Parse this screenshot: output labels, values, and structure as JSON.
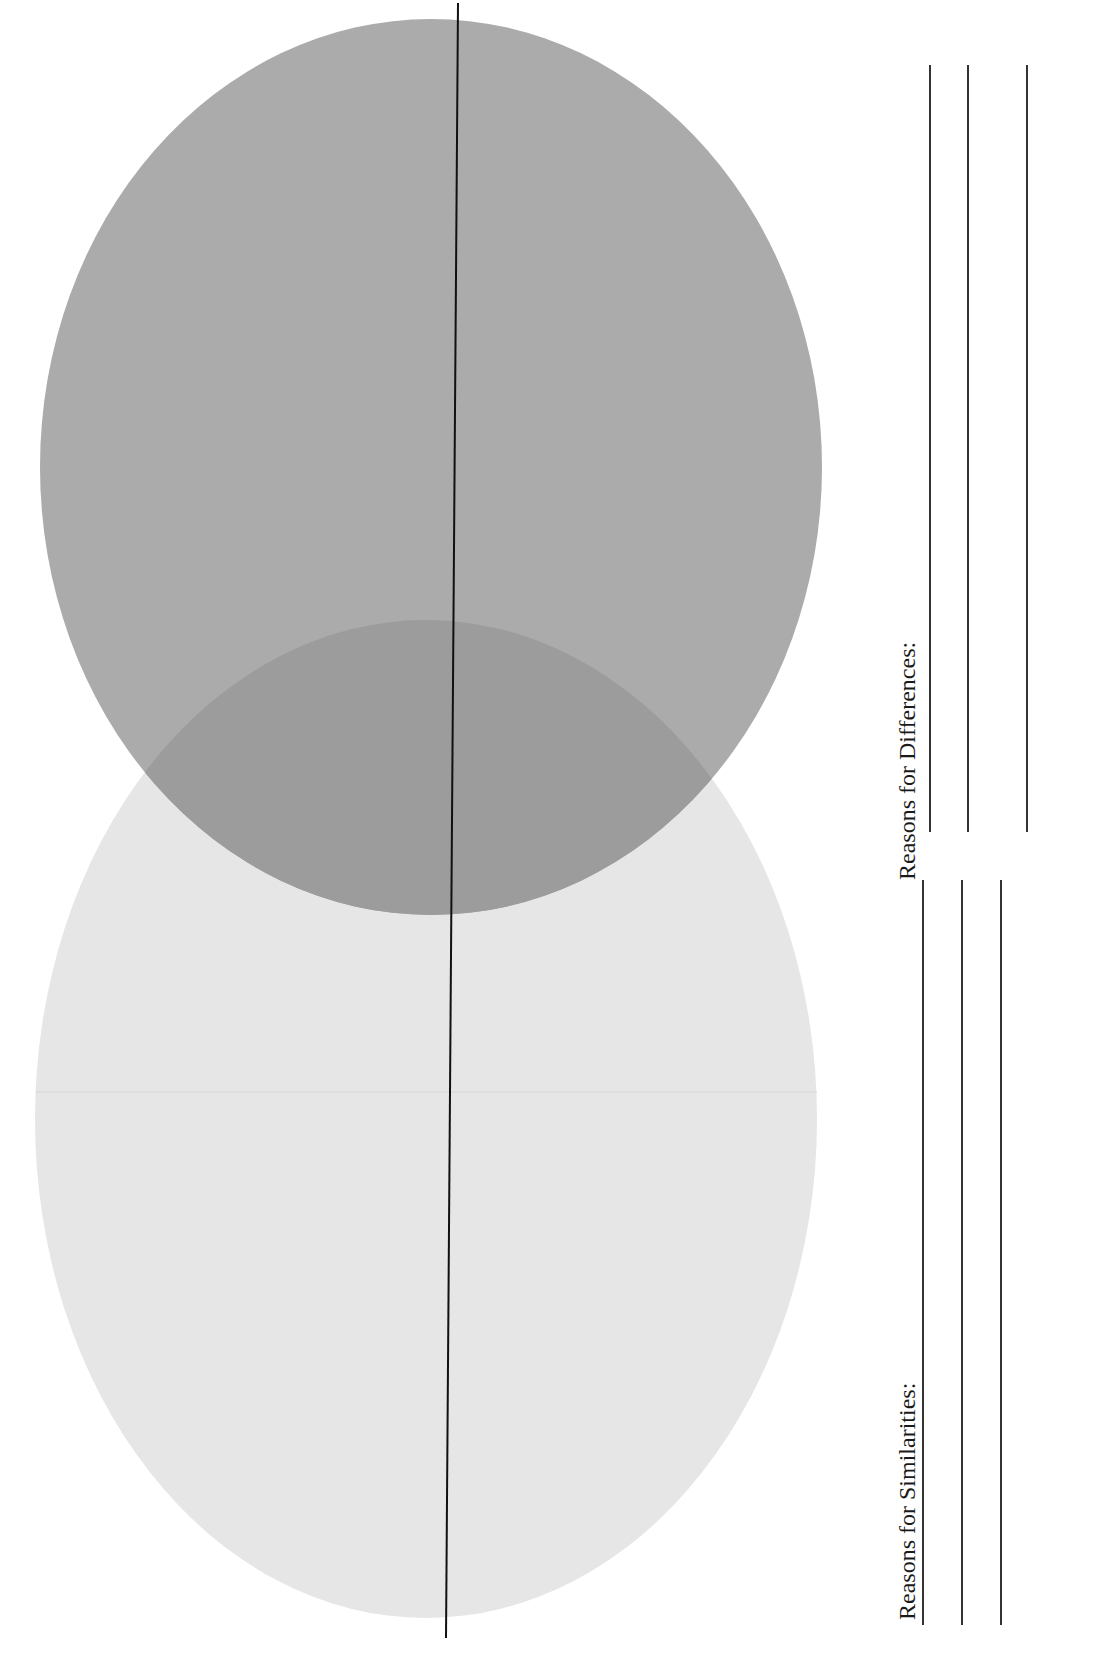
{
  "worksheet": {
    "title_cropped": "",
    "diagram_type": "venn-diagram",
    "circles": [
      {
        "id": "top-circle",
        "fill": "#ababab",
        "cx": 431,
        "cy": 467,
        "rx": 391,
        "ry": 448
      },
      {
        "id": "bottom-circle",
        "fill": "#e6e6e6",
        "cx": 426,
        "cy": 1119,
        "rx": 391,
        "ry": 499
      }
    ],
    "overlap_fill": "#9c9c9c",
    "divider_line": {
      "x1": 458,
      "y1": 3,
      "x2": 446,
      "y2": 1638,
      "color": "#111111"
    },
    "sections": [
      {
        "id": "differences",
        "label": "Reasons for Differences:",
        "line_count": 3
      },
      {
        "id": "similarities",
        "label": "Reasons for Similarities:",
        "line_count": 3
      }
    ]
  }
}
